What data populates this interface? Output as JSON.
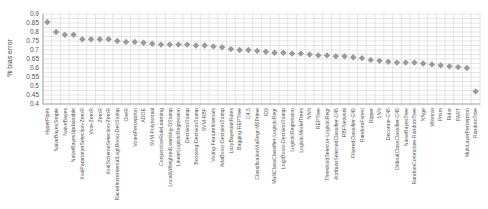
{
  "chart_data": {
    "type": "scatter",
    "title": "",
    "xlabel": "",
    "ylabel": "% bias error",
    "ylim": [
      0.4,
      0.9
    ],
    "yticks": [
      "0.9",
      "0.85",
      "0.8",
      "0.75",
      "0.7",
      "0.65",
      "0.6",
      "0.55",
      "0.5",
      "0.45",
      "0.4"
    ],
    "grid": true,
    "legend": null,
    "marker_color": "#9a9a9a",
    "categories": [
      "HyperPipes",
      "NaiveBayesSimple",
      "NaiveBayes",
      "NaiveBayesUpdateable",
      "XvalParameterSelection-ZeroR",
      "Vote-ZeroR",
      "ZeroR",
      "XvalSchemeSelection-ZeroR",
      "RacedIncrementalLogitBoost-DecStump",
      "OneR",
      "VotedPerceptron",
      "ADOE",
      "SVM-Polynomial",
      "ConjunctiveRuleLearning",
      "LocallyWeightedLearning-DStump",
      "LinearLogisticRegression",
      "DecisionStump",
      "Boosting-DecisionStump",
      "SVM-RBF",
      "Voting-FeatureIntervals",
      "AdaBoost-DecisionStump",
      "LazyBayesianRules",
      "Bagging-REPTree",
      "C4.5",
      "ClassificationViaRegr-M5Prime",
      "ID3",
      "MultiClassClassifier-LogisticRegr",
      "LogitBoost-DecisionStump",
      "LogisticRegression",
      "LogisticModelTrees",
      "NNN",
      "REPTree",
      "ThresholdSelector-LogisticRegr",
      "AttributeSelectedClassifier-C45",
      "RBFNetwork",
      "FilteredClassifier-C45",
      "RandomForest",
      "Ripper",
      "1NN",
      "Decorate-C45",
      "OrdinalClassClassifier-C45",
      "NaiveBayesTree",
      "RandomCommittee-RandomTree",
      "NNge",
      "Winnow",
      "Prism",
      "Ridor",
      "PART",
      "MultiLayerPerceptron",
      "RandomTree"
    ],
    "values": [
      0.855,
      0.8,
      0.785,
      0.785,
      0.76,
      0.76,
      0.76,
      0.76,
      0.75,
      0.745,
      0.745,
      0.74,
      0.735,
      0.73,
      0.73,
      0.73,
      0.73,
      0.725,
      0.725,
      0.72,
      0.715,
      0.705,
      0.7,
      0.7,
      0.695,
      0.69,
      0.685,
      0.685,
      0.68,
      0.68,
      0.675,
      0.67,
      0.67,
      0.665,
      0.665,
      0.66,
      0.655,
      0.645,
      0.64,
      0.635,
      0.63,
      0.63,
      0.63,
      0.625,
      0.62,
      0.615,
      0.61,
      0.605,
      0.6,
      0.47
    ]
  }
}
